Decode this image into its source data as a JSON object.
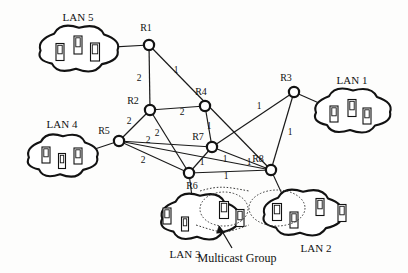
{
  "figure": {
    "annotation": "Multicast Group"
  },
  "lans": [
    {
      "id": "lan5",
      "label": "LAN 5",
      "hosts": 3,
      "cx": 78,
      "cy": 48,
      "rx": 52,
      "ry": 26,
      "label_x": 78,
      "label_y": 17
    },
    {
      "id": "lan4",
      "label": "LAN 4",
      "hosts": 3,
      "cx": 62,
      "cy": 155,
      "rx": 46,
      "ry": 24,
      "label_x": 62,
      "label_y": 124
    },
    {
      "id": "lan1",
      "label": "LAN 1",
      "hosts": 3,
      "cx": 352,
      "cy": 110,
      "rx": 50,
      "ry": 25,
      "label_x": 352,
      "label_y": 80
    },
    {
      "id": "lan3",
      "label": "LAN 3",
      "hosts": 4,
      "cx": 199,
      "cy": 216,
      "rx": 51,
      "ry": 26,
      "label_x": 185,
      "label_y": 254
    },
    {
      "id": "lan2",
      "label": "LAN 2",
      "hosts": 4,
      "cx": 302,
      "cy": 212,
      "rx": 52,
      "ry": 26,
      "label_x": 316,
      "label_y": 248
    }
  ],
  "routers": [
    {
      "id": "R1",
      "label": "R1",
      "x": 149,
      "y": 45,
      "label_x": 146,
      "label_y": 28
    },
    {
      "id": "R2",
      "label": "R2",
      "x": 150,
      "y": 110,
      "label_x": 133,
      "label_y": 101
    },
    {
      "id": "R3",
      "label": "R3",
      "x": 294,
      "y": 92,
      "label_x": 286,
      "label_y": 78
    },
    {
      "id": "R4",
      "label": "R4",
      "x": 205,
      "y": 106,
      "label_x": 201,
      "label_y": 92
    },
    {
      "id": "R5",
      "label": "R5",
      "x": 119,
      "y": 141,
      "label_x": 104,
      "label_y": 131
    },
    {
      "id": "R6",
      "label": "R6",
      "x": 189,
      "y": 173,
      "label_x": 192,
      "label_y": 186
    },
    {
      "id": "R7",
      "label": "R7",
      "x": 212,
      "y": 147,
      "label_x": 198,
      "label_y": 137
    },
    {
      "id": "R8",
      "label": "R8",
      "x": 271,
      "y": 170,
      "label_x": 258,
      "label_y": 159
    }
  ],
  "links": [
    {
      "from": "R1",
      "to": "R2",
      "weight": "2",
      "label_x": 139,
      "label_y": 79
    },
    {
      "from": "R1",
      "to": "R8",
      "weight": "1",
      "label_x": 176,
      "label_y": 71
    },
    {
      "from": "R2",
      "to": "R4",
      "weight": "2",
      "label_x": 182,
      "label_y": 113
    },
    {
      "from": "R2",
      "to": "R5",
      "weight": "2",
      "label_x": 129,
      "label_y": 122
    },
    {
      "from": "R2",
      "to": "R6",
      "weight": "2",
      "label_x": 157,
      "label_y": 134
    },
    {
      "from": "R4",
      "to": "R7",
      "weight": "1",
      "label_x": 209,
      "label_y": 127
    },
    {
      "from": "R5",
      "to": "R7",
      "weight": "2",
      "label_x": 148,
      "label_y": 141
    },
    {
      "from": "R5",
      "to": "R6",
      "weight": "2",
      "label_x": 143,
      "label_y": 161
    },
    {
      "from": "R5",
      "to": "R8",
      "weight": "1",
      "label_x": 249,
      "label_y": 163
    },
    {
      "from": "R6",
      "to": "R7",
      "weight": "1",
      "label_x": 202,
      "label_y": 163
    },
    {
      "from": "R6",
      "to": "R8",
      "weight": "1",
      "label_x": 226,
      "label_y": 177
    },
    {
      "from": "R7",
      "to": "R8",
      "weight": "1",
      "label_x": 225,
      "label_y": 160
    },
    {
      "from": "R7",
      "to": "R3",
      "weight": "1",
      "label_x": 259,
      "label_y": 107
    },
    {
      "from": "R3",
      "to": "R8",
      "weight": "1",
      "label_x": 290,
      "label_y": 133
    }
  ],
  "lan_links": [
    {
      "from": "lan5",
      "to": "R1"
    },
    {
      "from": "lan4",
      "to": "R5"
    },
    {
      "from": "lan1",
      "to": "R3"
    },
    {
      "from": "lan3",
      "to": "R6"
    },
    {
      "from": "lan2",
      "to": "R8"
    }
  ],
  "multicast": {
    "label": "Multicast Group",
    "label_x": 237,
    "label_y": 258,
    "groups": [
      {
        "in_lan": "lan3",
        "cx": 224,
        "cy": 209,
        "rx": 24,
        "ry": 17,
        "hosts": 2
      },
      {
        "in_lan": "lan2",
        "cx": 277,
        "cy": 208,
        "rx": 28,
        "ry": 18,
        "hosts": 2
      }
    ]
  },
  "colors": {
    "ink": "#121212",
    "paper": "#fdfdfc",
    "edge": "#1a1a1a",
    "dotted": "#3a3a3a"
  }
}
